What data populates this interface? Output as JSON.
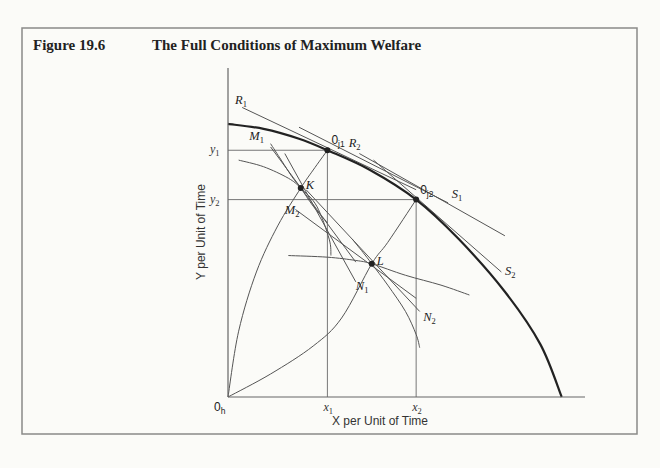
{
  "figure": {
    "number": "Figure 19.6",
    "title": "The Full Conditions of Maximum Welfare"
  },
  "chart_data": {
    "type": "diagram",
    "title": "The Full Conditions of Maximum Welfare",
    "xlabel": "X per Unit of Time",
    "ylabel": "Y per Unit of Time",
    "xlim": [
      0,
      100
    ],
    "ylim": [
      0,
      100
    ],
    "origin_label": "0",
    "origin_sub": "h",
    "x_ticks": [
      {
        "label": "x",
        "sub": "1",
        "value": 28
      },
      {
        "label": "x",
        "sub": "2",
        "value": 53
      }
    ],
    "y_ticks": [
      {
        "label": "y",
        "sub": "1",
        "value": 75
      },
      {
        "label": "y",
        "sub": "2",
        "value": 60
      }
    ],
    "frontier": {
      "name": "production possibility curve",
      "points": [
        [
          0,
          83
        ],
        [
          10,
          81.5
        ],
        [
          20,
          78.5
        ],
        [
          28,
          75
        ],
        [
          40,
          69
        ],
        [
          53,
          60
        ],
        [
          65,
          48
        ],
        [
          78,
          32
        ],
        [
          88,
          16
        ],
        [
          94,
          0
        ]
      ]
    },
    "points": [
      {
        "id": "oj1",
        "label": "0",
        "sub": "j1",
        "x": 28,
        "y": 75
      },
      {
        "id": "oj2",
        "label": "0",
        "sub": "j2",
        "x": 53,
        "y": 60
      },
      {
        "id": "K",
        "label": "K",
        "sub": "",
        "x": 20.5,
        "y": 63.5
      },
      {
        "id": "L",
        "label": "L",
        "sub": "",
        "x": 40.5,
        "y": 40.5
      }
    ],
    "tangent_lines": [
      {
        "label": "R",
        "sub": "1",
        "from": [
          4,
          88
        ],
        "to": [
          53,
          63
        ]
      },
      {
        "label": "R",
        "sub": "2",
        "from": [
          37,
          74
        ],
        "to": [
          78,
          49
        ]
      },
      {
        "label": "S",
        "sub": "1",
        "from": [
          20,
          82
        ],
        "to": [
          62,
          59
        ]
      },
      {
        "label": "S",
        "sub": "2",
        "from": [
          41,
          72
        ],
        "to": [
          77,
          38
        ]
      },
      {
        "label": "M",
        "sub": "1",
        "from": [
          12,
          76
        ],
        "to": [
          36,
          41
        ]
      },
      {
        "label": "M",
        "sub": "2",
        "from": [
          19,
          57
        ],
        "to": [
          53,
          30
        ]
      },
      {
        "label": "N",
        "sub": "1",
        "from": [
          16,
          74
        ],
        "to": [
          36,
          35
        ]
      },
      {
        "label": "N",
        "sub": "2",
        "from": [
          22,
          63
        ],
        "to": [
          54,
          26
        ]
      }
    ],
    "labels": [
      {
        "text": "R",
        "sub": "1",
        "x": 2,
        "y": 89
      },
      {
        "text": "R",
        "sub": "2",
        "x": 34,
        "y": 76
      },
      {
        "text": "S",
        "sub": "1",
        "x": 63,
        "y": 60.5
      },
      {
        "text": "S",
        "sub": "2",
        "x": 78,
        "y": 37
      },
      {
        "text": "M",
        "sub": "1",
        "x": 6,
        "y": 78
      },
      {
        "text": "M",
        "sub": "2",
        "x": 16,
        "y": 55.5
      },
      {
        "text": "N",
        "sub": "1",
        "x": 36,
        "y": 32.5
      },
      {
        "text": "N",
        "sub": "2",
        "x": 55,
        "y": 23
      }
    ],
    "indifference_curves": [
      {
        "name": "indiff-K",
        "points": [
          [
            3,
            72
          ],
          [
            10,
            70
          ],
          [
            17,
            66.5
          ],
          [
            20.5,
            63.5
          ],
          [
            25,
            58
          ],
          [
            28.5,
            48
          ],
          [
            29,
            43
          ]
        ]
      },
      {
        "name": "indiff-L",
        "points": [
          [
            17,
            43
          ],
          [
            28,
            42.5
          ],
          [
            36,
            41.5
          ],
          [
            40.5,
            40.5
          ],
          [
            50,
            37
          ],
          [
            60,
            34
          ],
          [
            68,
            31
          ]
        ]
      },
      {
        "name": "indiff-K2",
        "points": [
          [
            12,
            77
          ],
          [
            15,
            72
          ],
          [
            18,
            67
          ],
          [
            20.5,
            63.5
          ],
          [
            24,
            58
          ],
          [
            28,
            53
          ]
        ]
      },
      {
        "name": "indiff-L2",
        "points": [
          [
            35,
            48
          ],
          [
            38,
            44
          ],
          [
            40.5,
            40.5
          ],
          [
            45,
            34
          ],
          [
            50,
            26
          ],
          [
            53,
            19
          ],
          [
            54,
            15
          ]
        ]
      }
    ],
    "contract_curves": [
      {
        "name": "contract-curve-1",
        "points": [
          [
            0,
            0
          ],
          [
            3,
            20
          ],
          [
            8,
            38
          ],
          [
            14,
            52
          ],
          [
            20.5,
            63.5
          ],
          [
            24,
            69
          ],
          [
            28,
            75
          ]
        ]
      },
      {
        "name": "contract-curve-2",
        "points": [
          [
            0,
            0
          ],
          [
            12,
            7
          ],
          [
            24,
            15.5
          ],
          [
            32,
            24
          ],
          [
            40.5,
            40.5
          ],
          [
            45,
            47
          ],
          [
            53,
            60
          ]
        ]
      }
    ]
  }
}
